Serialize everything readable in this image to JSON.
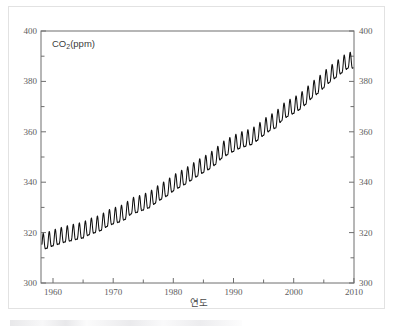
{
  "figure": {
    "series_label_prefix": "CO",
    "series_label_sub": "2",
    "series_label_suffix": "(ppm)",
    "xlabel": "연도",
    "line_color": "#101010",
    "axis_color": "#6e6e6e",
    "tick_label_color": "#5d5d5d",
    "border_color": "#e2e2e2",
    "background": "#ffffff"
  },
  "axes": {
    "y_left_ticks": [
      "400",
      "380",
      "360",
      "340",
      "320",
      "300"
    ],
    "y_right_ticks": [
      "400",
      "380",
      "360",
      "340",
      "320",
      "300"
    ],
    "x_ticks": [
      "1960",
      "1970",
      "1980",
      "1990",
      "2000",
      "2010"
    ],
    "y_minor_step": 10,
    "x_minor_step": 5
  },
  "chart_data": {
    "type": "line",
    "title": "",
    "subtitle": "",
    "xlabel": "연도",
    "ylabel": "CO2(ppm)",
    "series_name": "CO2(ppm)",
    "xlim": [
      1958,
      2010
    ],
    "ylim": [
      300,
      400
    ],
    "xticks": [
      1960,
      1970,
      1980,
      1990,
      2000,
      2010
    ],
    "yticks": [
      300,
      320,
      340,
      360,
      380,
      400
    ],
    "x_minor_ticks": [
      1965,
      1975,
      1985,
      1995,
      2005
    ],
    "y_minor_ticks": [
      310,
      330,
      350,
      370,
      390
    ],
    "grid": false,
    "legend": "none",
    "annotation": "CO2(ppm) label inside upper-left of plot area",
    "annual_mean": {
      "x": [
        1958,
        1959,
        1960,
        1961,
        1962,
        1963,
        1964,
        1965,
        1966,
        1967,
        1968,
        1969,
        1970,
        1971,
        1972,
        1973,
        1974,
        1975,
        1976,
        1977,
        1978,
        1979,
        1980,
        1981,
        1982,
        1983,
        1984,
        1985,
        1986,
        1987,
        1988,
        1989,
        1990,
        1991,
        1992,
        1993,
        1994,
        1995,
        1996,
        1997,
        1998,
        1999,
        2000,
        2001,
        2002,
        2003,
        2004,
        2005,
        2006,
        2007,
        2008,
        2009
      ],
      "y": [
        315.3,
        315.9,
        316.9,
        317.6,
        318.4,
        318.9,
        319.5,
        320.0,
        321.3,
        322.1,
        323.0,
        324.6,
        325.6,
        326.3,
        327.4,
        329.6,
        330.2,
        331.1,
        332.0,
        333.8,
        335.4,
        336.8,
        338.7,
        340.1,
        341.4,
        343.0,
        344.6,
        346.0,
        347.4,
        349.2,
        351.6,
        353.1,
        354.4,
        355.6,
        356.4,
        357.1,
        358.8,
        360.8,
        362.6,
        363.7,
        366.6,
        368.3,
        369.5,
        371.0,
        373.1,
        375.6,
        377.4,
        379.7,
        381.9,
        383.7,
        385.6,
        387.4
      ]
    },
    "seasonal_amplitude_ppm": 3.1,
    "seasonal_peak_month": "May",
    "seasonal_trough_month": "September"
  }
}
